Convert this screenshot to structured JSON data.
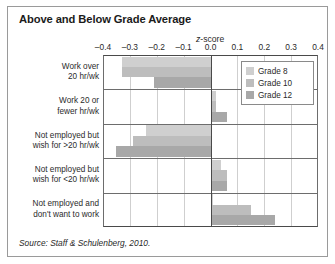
{
  "figure": {
    "title": "Above and Below Grade Average",
    "source": "Source: Staff & Schulenberg, 2010."
  },
  "legend": {
    "position": "top-right-inside-plot",
    "items": [
      {
        "label": "Grade 8",
        "color": "#cfcfcf"
      },
      {
        "label": "Grade 10",
        "color": "#bdbdbd"
      },
      {
        "label": "Grade 12",
        "color": "#a8a8a8"
      }
    ]
  },
  "chart_data": {
    "type": "bar",
    "orientation": "horizontal",
    "title": "Above and Below Grade Average",
    "subtitle": "",
    "xlabel": "z-score",
    "ylabel": "",
    "xlim": [
      -0.4,
      0.4
    ],
    "xticks": [
      -0.4,
      -0.3,
      -0.2,
      -0.1,
      0.0,
      0.1,
      0.2,
      0.3,
      0.4
    ],
    "xticklabels": [
      "–0.4",
      "–0.3",
      "–0.2",
      "–0.1",
      "0.0",
      "0.1",
      "0.2",
      "0.3",
      "0.4"
    ],
    "grid": true,
    "grid_axis": "x",
    "zero_reference_line": 0.0,
    "categories": [
      "Work over 20 hr/wk",
      "Work 20 or fewer hr/wk",
      "Not employed but wish for >20 hr/wk",
      "Not employed but wish for <20 hr/wk",
      "Not employed and don't want to work"
    ],
    "category_lines": [
      [
        "Work over",
        "20 hr/wk"
      ],
      [
        "Work 20 or",
        "fewer hr/wk"
      ],
      [
        "Not employed but",
        "wish for >20 hr/wk"
      ],
      [
        "Not employed but",
        "wish for <20 hr/wk"
      ],
      [
        "Not employed and",
        "don't want to work"
      ]
    ],
    "series": [
      {
        "name": "Grade 8",
        "color": "#cfcfcf",
        "values": [
          -0.33,
          0.02,
          -0.24,
          0.04,
          0.01
        ]
      },
      {
        "name": "Grade 10",
        "color": "#bdbdbd",
        "values": [
          -0.33,
          0.02,
          -0.29,
          0.06,
          0.15
        ]
      },
      {
        "name": "Grade 12",
        "color": "#a8a8a8",
        "values": [
          -0.21,
          0.06,
          -0.35,
          0.06,
          0.24
        ]
      }
    ]
  }
}
